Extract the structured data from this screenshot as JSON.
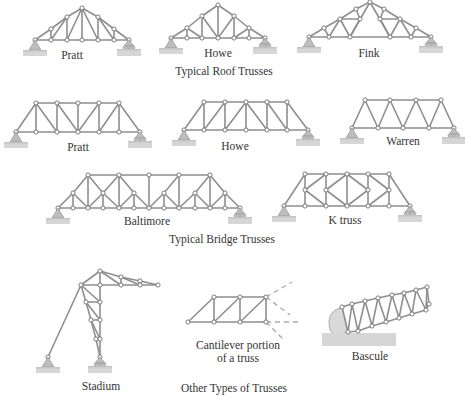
{
  "figure": {
    "sections": [
      {
        "caption": "Typical Roof Trusses",
        "trusses": [
          {
            "id": "roof-pratt",
            "label": "Pratt"
          },
          {
            "id": "roof-howe",
            "label": "Howe"
          },
          {
            "id": "roof-fink",
            "label": "Fink"
          }
        ]
      },
      {
        "caption": "Typical Bridge Trusses",
        "trusses": [
          {
            "id": "bridge-pratt",
            "label": "Pratt"
          },
          {
            "id": "bridge-howe",
            "label": "Howe"
          },
          {
            "id": "bridge-warren",
            "label": "Warren"
          },
          {
            "id": "bridge-baltimore",
            "label": "Baltimore"
          },
          {
            "id": "bridge-k",
            "label": "K truss"
          }
        ]
      },
      {
        "caption": "Other Types of Trusses",
        "trusses": [
          {
            "id": "other-stadium",
            "label": "Stadium"
          },
          {
            "id": "other-cantilever",
            "label_line1": "Cantilever portion",
            "label_line2": "of a truss"
          },
          {
            "id": "other-bascule",
            "label": "Bascule"
          }
        ]
      }
    ],
    "colors": {
      "member": "#8f8f8f",
      "node_fill": "#ffffff",
      "support": "#bdbdbd",
      "ground": "#d6d6d6",
      "text": "#333333"
    }
  }
}
